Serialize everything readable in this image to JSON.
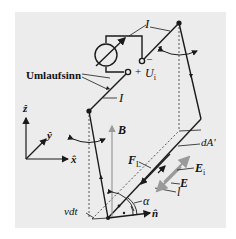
{
  "diagram": {
    "title": "",
    "labels": {
      "current_top": "I",
      "current_left": "I",
      "current_bottom": "l",
      "sense_of_rotation": "Umlaufsinn",
      "voltage_plus": "+",
      "voltage_minus": "–",
      "voltage": "U",
      "voltage_sub": "i",
      "axis_z": "ẑ",
      "axis_y": "ŷ",
      "axis_x": "x̂",
      "field_B": "B",
      "force": "F",
      "force_sub": "L",
      "area": "dA'",
      "induced_field": "E",
      "induced_field_sub": "i",
      "field_E": "E",
      "velocity": "vdt",
      "angle": "α",
      "normal": "n̂"
    },
    "colors": {
      "background": "#ececec",
      "line": "#1a1a1a",
      "gray_arrow": "#9a9a9a",
      "dashed": "#555555"
    }
  }
}
